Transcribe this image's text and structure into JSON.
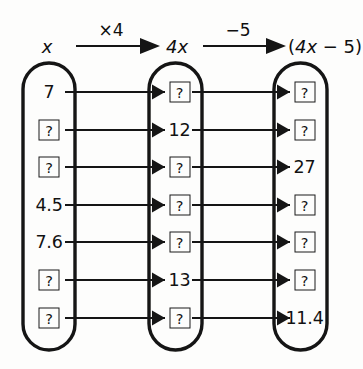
{
  "diagram": {
    "title_row": {
      "input_label": "x",
      "op1_label": "×4",
      "middle_label": "4x",
      "op2_label": "−5",
      "output_label": "(4x − 5)"
    },
    "unknown_marker": "?",
    "columns": [
      {
        "name": "input-column",
        "header": "x",
        "values": [
          "7",
          "?",
          "?",
          "4.5",
          "7.6",
          "?",
          "?"
        ]
      },
      {
        "name": "middle-column",
        "header": "4x",
        "values": [
          "?",
          "12",
          "?",
          "?",
          "?",
          "13",
          "?"
        ]
      },
      {
        "name": "output-column",
        "header": "(4x − 5)",
        "values": [
          "?",
          "?",
          "27",
          "?",
          "?",
          "?",
          "11.4"
        ]
      }
    ],
    "colors": {
      "ink": "#151515",
      "paper": "#fdfdfc"
    }
  }
}
